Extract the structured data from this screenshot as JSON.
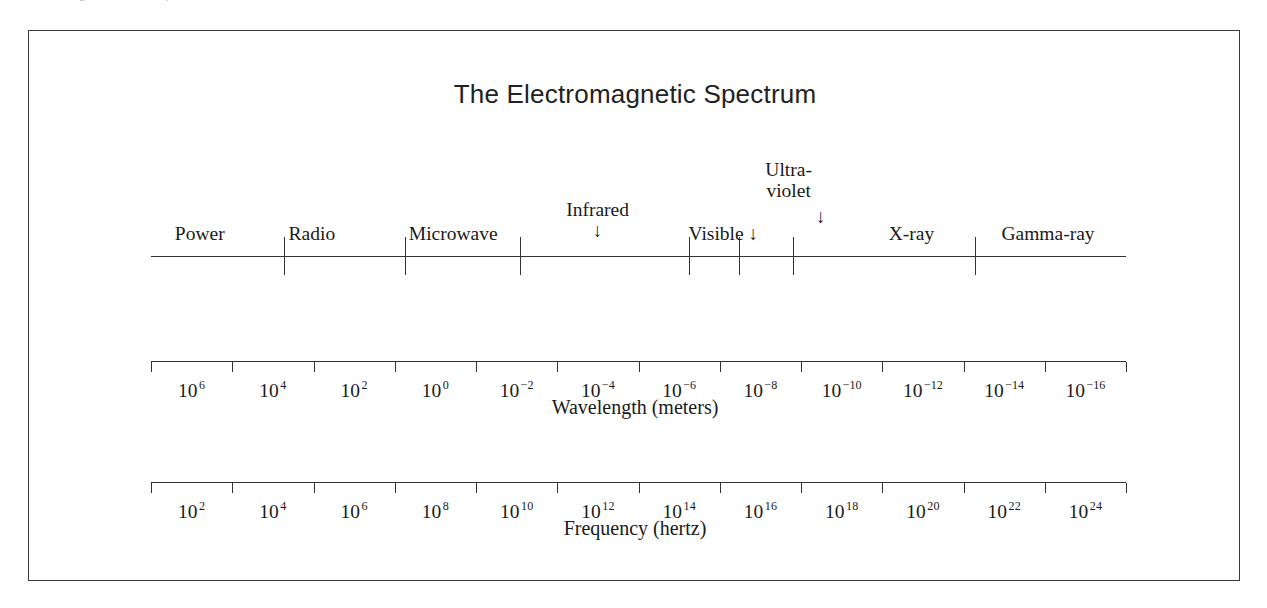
{
  "scan": {
    "top_caption_left": "Electromagnetic radiation spectrum",
    "top_caption_right": "1"
  },
  "figure": {
    "title": "The Electromagnetic Spectrum"
  },
  "chart_data": {
    "type": "line",
    "title": "The Electromagnetic Spectrum",
    "xlabel": "Wavelength (meters) / Frequency (hertz)",
    "ylabel": "",
    "grid": false,
    "legend": "none",
    "bands": [
      {
        "name": "Power",
        "label": "Power",
        "arrow": false,
        "multiline": false,
        "center_pct": 5.0
      },
      {
        "name": "Radio",
        "label": "Radio",
        "arrow": false,
        "multiline": false,
        "center_pct": 16.5
      },
      {
        "name": "Microwave",
        "label": "Microwave",
        "arrow": false,
        "multiline": false,
        "center_pct": 31.0
      },
      {
        "name": "Infrared",
        "label": "Infrared",
        "arrow": true,
        "multiline": false,
        "center_pct": 45.8
      },
      {
        "name": "Visible",
        "label": "Visible",
        "arrow": true,
        "multiline": false,
        "center_pct": 58.7
      },
      {
        "name": "Ultraviolet",
        "label": "Ultra-violet",
        "arrow": true,
        "multiline": true,
        "center_pct": 65.4
      },
      {
        "name": "X-ray",
        "label": "X-ray",
        "arrow": false,
        "multiline": false,
        "center_pct": 78.0
      },
      {
        "name": "Gamma-ray",
        "label": "Gamma-ray",
        "arrow": false,
        "multiline": false,
        "center_pct": 92.0
      }
    ],
    "band_boundaries_pct": [
      13.6,
      26.1,
      37.8,
      55.2,
      60.3,
      65.8,
      84.5
    ],
    "wavelength_axis": {
      "caption": "Wavelength (meters)",
      "unit": "meters",
      "base": 10,
      "exponents": [
        6,
        4,
        2,
        0,
        -2,
        -4,
        -6,
        -8,
        -10,
        -12,
        -14,
        -16
      ],
      "tick_count": 13,
      "range": [
        6,
        -18
      ]
    },
    "frequency_axis": {
      "caption": "Frequency (hertz)",
      "unit": "hertz",
      "base": 10,
      "exponents": [
        2,
        4,
        6,
        8,
        10,
        12,
        14,
        16,
        18,
        20,
        22,
        24
      ],
      "tick_count": 13,
      "range": [
        2,
        26
      ]
    },
    "glyphs": {
      "down_arrow": "↓"
    }
  },
  "colors": {
    "ink": "#1a1a1a",
    "rule": "#333333",
    "frame": "#3a3a3a",
    "paper": "#ffffff"
  }
}
